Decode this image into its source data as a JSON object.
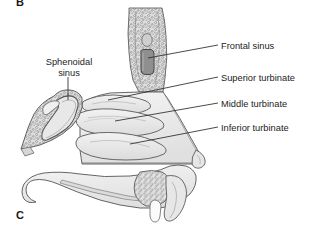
{
  "figure": {
    "type": "anatomical-illustration",
    "background_color": "#ffffff"
  },
  "panels": {
    "top_letter": "B",
    "bottom_letter": "C"
  },
  "labels": {
    "frontal_sinus": "Frontal sinus",
    "superior_turbinate": "Superior turbinate",
    "middle_turbinate": "Middle turbinate",
    "inferior_turbinate": "Inferior turbinate",
    "sphenoidal_sinus_line1": "Sphenoidal",
    "sphenoidal_sinus_line2": "sinus"
  },
  "colors": {
    "outline": "#555555",
    "tissue_fill": "#e9e9e9",
    "tissue_fill_light": "#f1f1f1",
    "bone_fill": "#dcdcdc",
    "sinus_cavity": "#8e8e8e",
    "stipple": "#7a7a7a",
    "leader_line": "#2b2b2b",
    "text": "#1d1d1d"
  }
}
